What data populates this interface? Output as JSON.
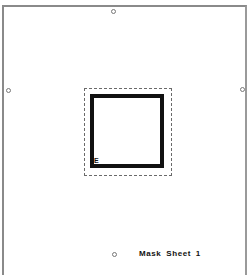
{
  "diagram": {
    "label": "Mask Sheet 1",
    "corner_marker": "E",
    "registration_marks": [
      {
        "position": "top",
        "x": 113,
        "y": 11
      },
      {
        "position": "left",
        "x": 8,
        "y": 90
      },
      {
        "position": "right",
        "x": 242,
        "y": 89
      },
      {
        "position": "bottom",
        "x": 114,
        "y": 254
      }
    ],
    "colors": {
      "frame": "#8a8a8a",
      "square": "#111111",
      "dashed_outline": "#6a6a6a",
      "background": "#ffffff"
    }
  }
}
